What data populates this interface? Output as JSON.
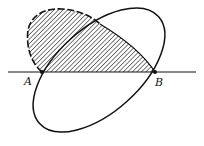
{
  "diagram": {
    "type": "geometric-figure",
    "points": [
      {
        "label": "A",
        "x": 42,
        "y": 72
      },
      {
        "label": "B",
        "x": 155,
        "y": 72
      }
    ],
    "labels": {
      "a": "A",
      "b": "B"
    },
    "colors": {
      "stroke": "#111111",
      "background": "#ffffff"
    }
  }
}
